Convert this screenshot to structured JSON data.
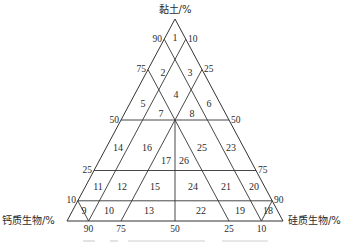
{
  "figure": {
    "type": "ternary-classification-diagram",
    "axes": {
      "top": "黏土/%",
      "left": "钙质生物/%",
      "right": "硅质生物/%"
    },
    "ticks": {
      "left_side": [
        "90",
        "75",
        "50",
        "25",
        "10"
      ],
      "right_side": [
        "10",
        "25",
        "50",
        "75",
        "90"
      ],
      "bottom": [
        "90",
        "75",
        "50",
        "25",
        "10"
      ]
    },
    "regions": {
      "r1": "1",
      "r2": "2",
      "r3": "3",
      "r4": "4",
      "r5": "5",
      "r6": "6",
      "r7": "7",
      "r8": "8",
      "r9": "9",
      "r10": "10",
      "r11": "11",
      "r12": "12",
      "r13": "13",
      "r14": "14",
      "r15": "15",
      "r16": "16",
      "r17": "17",
      "r18": "18",
      "r19": "19",
      "r20": "20",
      "r21": "21",
      "r22": "22",
      "r23": "23",
      "r24": "24",
      "r25": "25",
      "r26": "26"
    },
    "caption_visible": false
  }
}
